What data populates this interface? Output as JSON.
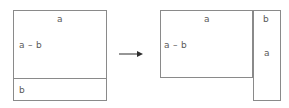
{
  "figure": {
    "type": "geometric-dissection-diagram",
    "background_color": "#ffffff",
    "stroke_color": "#8a8a8a",
    "arrow_color": "#2e2e2e",
    "text_color": "#5a5a5a"
  },
  "left_figure": {
    "name": "original-square",
    "outer": {
      "x": 13,
      "y": 10,
      "width": 94,
      "height": 91
    },
    "divider": {
      "y": 78,
      "orientation": "horizontal"
    },
    "labels": {
      "top": "a",
      "side": "a – b",
      "bottom": "b"
    },
    "label_positions": {
      "top": {
        "x": 57,
        "y": 14
      },
      "side": {
        "x": 19,
        "y": 40
      },
      "bottom": {
        "x": 19,
        "y": 85
      }
    }
  },
  "arrow": {
    "name": "transformation-arrow",
    "x": 119,
    "y": 54,
    "length": 24,
    "direction": "right"
  },
  "right_figure": {
    "name": "rearranged-shape",
    "main_rect": {
      "x": 160,
      "y": 10,
      "width": 93,
      "height": 68
    },
    "side_rect": {
      "x": 253,
      "y": 10,
      "width": 28,
      "height": 91
    },
    "labels": {
      "top": "a",
      "side": "a – b",
      "strip_top": "b",
      "strip_side": "a"
    },
    "label_positions": {
      "top": {
        "x": 204,
        "y": 14
      },
      "side": {
        "x": 164,
        "y": 40
      },
      "strip_top": {
        "x": 263,
        "y": 14
      },
      "strip_side": {
        "x": 264,
        "y": 48
      }
    }
  }
}
